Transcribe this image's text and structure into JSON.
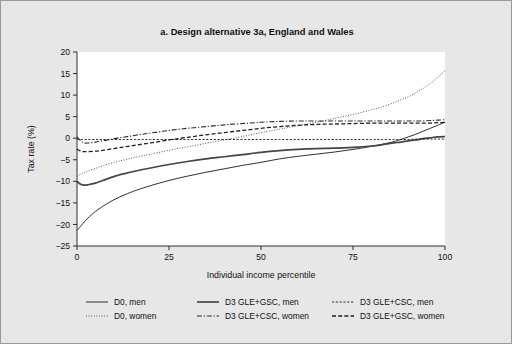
{
  "figure": {
    "background_color": "#e7e7e7",
    "plot_background_color": "#ffffff",
    "border_color": "#9a9a9a"
  },
  "chart_data": {
    "type": "line",
    "title": "a. Design alternative 3a, England and Wales",
    "xlabel": "Individual income percentile",
    "ylabel": "Tax rate (%)",
    "xlim": [
      0,
      100
    ],
    "ylim": [
      -25,
      20
    ],
    "xticks": [
      0,
      25,
      50,
      75,
      100
    ],
    "yticks": [
      20,
      15,
      10,
      5,
      0,
      -5,
      -10,
      -15,
      -20,
      -25
    ],
    "xtick_labels": [
      "0",
      "25",
      "50",
      "75",
      "100"
    ],
    "ytick_labels": [
      "20",
      "15",
      "10",
      "5",
      "0",
      "−5",
      "−10",
      "−15",
      "−20",
      "−25"
    ],
    "grid": false,
    "legend_position": "below",
    "x": [
      0,
      1,
      2,
      3,
      5,
      7,
      10,
      13,
      16,
      20,
      25,
      30,
      35,
      40,
      45,
      50,
      55,
      60,
      65,
      70,
      75,
      80,
      83,
      86,
      88,
      90,
      92,
      94,
      96,
      98,
      100
    ],
    "series": [
      {
        "name": "D0, men",
        "key": "d0_men",
        "style": "solid",
        "width": 0.9,
        "color": "#1a1a1a",
        "dasharray": "",
        "values": [
          -21.4,
          -20.4,
          -19.4,
          -18.5,
          -17.0,
          -15.8,
          -14.3,
          -13.1,
          -12.1,
          -11.0,
          -9.8,
          -8.8,
          -7.9,
          -7.1,
          -6.3,
          -5.6,
          -4.8,
          -4.2,
          -3.7,
          -3.2,
          -2.6,
          -1.9,
          -1.4,
          -0.8,
          -0.3,
          0.3,
          0.9,
          1.6,
          2.3,
          3.0,
          3.7
        ]
      },
      {
        "name": "D0, women",
        "key": "d0_women",
        "style": "dotted",
        "width": 1.0,
        "color": "#5a5a5a",
        "dasharray": "1,1.6",
        "values": [
          -8.8,
          -8.4,
          -8.0,
          -7.6,
          -7.0,
          -6.4,
          -5.6,
          -5.0,
          -4.4,
          -3.7,
          -2.8,
          -2.0,
          -1.2,
          -0.4,
          0.4,
          1.3,
          2.1,
          2.9,
          3.7,
          4.6,
          5.5,
          6.6,
          7.3,
          8.2,
          8.9,
          9.6,
          10.5,
          11.5,
          12.7,
          14.1,
          15.6
        ]
      },
      {
        "name": "D3 GLE+GSC, men",
        "key": "d3_gle_gsc_men",
        "style": "solid",
        "width": 1.7,
        "color": "#454545",
        "dasharray": "",
        "values": [
          -10.0,
          -10.7,
          -10.9,
          -10.8,
          -10.4,
          -9.8,
          -8.9,
          -8.2,
          -7.6,
          -6.9,
          -6.1,
          -5.4,
          -4.8,
          -4.3,
          -3.8,
          -3.3,
          -2.9,
          -2.6,
          -2.4,
          -2.3,
          -2.1,
          -1.8,
          -1.5,
          -1.1,
          -0.9,
          -0.6,
          -0.4,
          -0.1,
          0.1,
          0.3,
          0.4
        ]
      },
      {
        "name": "D3 GLE+CSC, men",
        "key": "d3_gle_csc_men",
        "style": "dashed-fine",
        "width": 0.9,
        "color": "#1a1a1a",
        "dasharray": "2.2,1.6",
        "values": [
          -0.2,
          -0.3,
          -0.3,
          -0.3,
          -0.3,
          -0.3,
          -0.3,
          -0.3,
          -0.3,
          -0.3,
          -0.3,
          -0.3,
          -0.3,
          -0.3,
          -0.3,
          -0.3,
          -0.3,
          -0.3,
          -0.3,
          -0.3,
          -0.3,
          -0.3,
          -0.3,
          -0.3,
          -0.3,
          -0.3,
          -0.2,
          -0.2,
          -0.2,
          -0.2,
          -0.2
        ]
      },
      {
        "name": "D3 GLE+CSC, women",
        "key": "d3_gle_csc_women",
        "style": "dash-dot",
        "width": 1.1,
        "color": "#2a2a2a",
        "dasharray": "5,1.8,1.2,1.8",
        "values": [
          0.3,
          -0.6,
          -1.1,
          -1.1,
          -0.9,
          -0.6,
          -0.1,
          0.3,
          0.7,
          1.2,
          1.8,
          2.3,
          2.7,
          3.1,
          3.4,
          3.7,
          3.9,
          4.0,
          4.0,
          4.0,
          4.0,
          4.0,
          4.0,
          4.0,
          4.0,
          4.0,
          4.0,
          4.0,
          4.1,
          4.2,
          4.3
        ]
      },
      {
        "name": "D3 GLE+GSC, women",
        "key": "d3_gle_gsc_women",
        "style": "dashed",
        "width": 1.3,
        "color": "#1f1f1f",
        "dasharray": "4,2.2",
        "values": [
          -2.5,
          -3.0,
          -3.1,
          -3.1,
          -3.0,
          -2.8,
          -2.4,
          -2.0,
          -1.6,
          -1.1,
          -0.4,
          0.2,
          0.8,
          1.3,
          1.8,
          2.3,
          2.7,
          3.0,
          3.2,
          3.3,
          3.4,
          3.5,
          3.5,
          3.5,
          3.5,
          3.5,
          3.5,
          3.5,
          3.5,
          3.6,
          3.7
        ]
      }
    ],
    "legend": [
      {
        "label": "D0, men",
        "key": "d0_men"
      },
      {
        "label": "D3 GLE+GSC, men",
        "key": "d3_gle_gsc_men"
      },
      {
        "label": "D3 GLE+CSC, men",
        "key": "d3_gle_csc_men"
      },
      {
        "label": "D0, women",
        "key": "d0_women"
      },
      {
        "label": "D3 GLE+CSC, women",
        "key": "d3_gle_csc_women"
      },
      {
        "label": "D3 GLE+GSC, women",
        "key": "d3_gle_gsc_women"
      }
    ]
  }
}
